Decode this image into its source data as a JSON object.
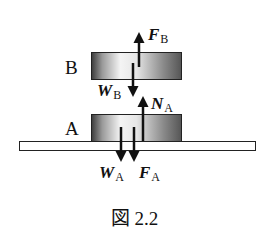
{
  "diagram": {
    "blocks": [
      {
        "id": "B",
        "label": "B"
      },
      {
        "id": "A",
        "label": "A"
      }
    ],
    "forces": {
      "F_B": {
        "symbol": "F",
        "subscript": "B",
        "direction": "up"
      },
      "W_B": {
        "symbol": "W",
        "subscript": "B",
        "direction": "down"
      },
      "N_A": {
        "symbol": "N",
        "subscript": "A",
        "direction": "up"
      },
      "W_A": {
        "symbol": "W",
        "subscript": "A",
        "direction": "down"
      },
      "F_A": {
        "symbol": "F",
        "subscript": "A",
        "direction": "down"
      }
    },
    "caption": "図 2.2"
  }
}
